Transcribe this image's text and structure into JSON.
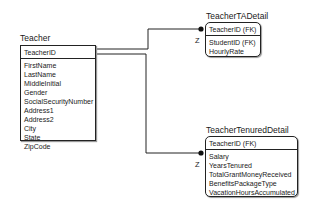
{
  "entities": {
    "teacher": {
      "title": "Teacher",
      "primary_key": [
        "TeacherID"
      ],
      "attributes": [
        "FirstName",
        "LastName",
        "MiddleInitial",
        "Gender",
        "SocialSecurityNumber",
        "Address1",
        "Address2",
        "City",
        "State",
        "ZipCode"
      ]
    },
    "ta_detail": {
      "title": "TeacherTADetail",
      "primary_key": [
        "TeacherID (FK)"
      ],
      "attributes": [
        "StudentID (FK)",
        "HourlyRate"
      ]
    },
    "tenured_detail": {
      "title": "TeacherTenuredDetail",
      "primary_key": [
        "TeacherID (FK)"
      ],
      "attributes": [
        "Salary",
        "YearsTenured",
        "TotalGrantMoneyReceived",
        "BenefitsPackageType",
        "VacationHoursAccumulated"
      ]
    }
  },
  "relationships": [
    {
      "from": "Teacher",
      "to": "TeacherTADetail",
      "cardinality_label": "Z"
    },
    {
      "from": "Teacher",
      "to": "TeacherTenuredDetail",
      "cardinality_label": "Z"
    }
  ]
}
